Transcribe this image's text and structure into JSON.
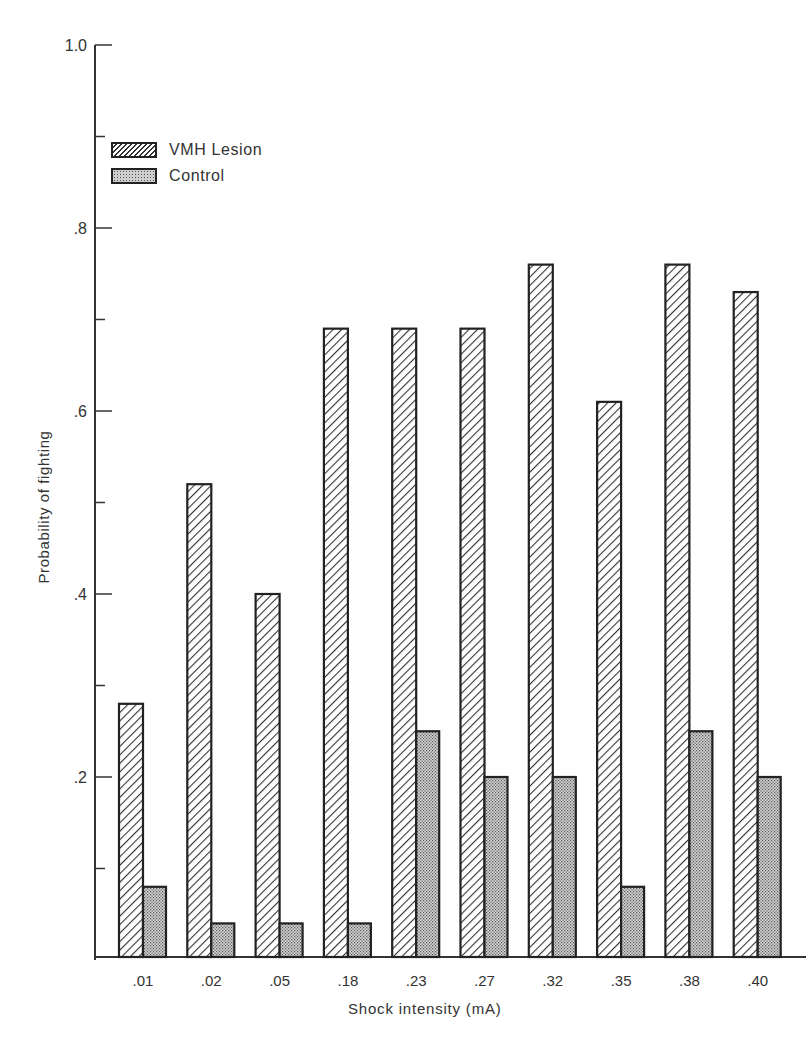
{
  "chart_data": {
    "type": "bar",
    "title": "",
    "xlabel": "Shock intensity (mA)",
    "ylabel": "Probability of fighting",
    "ylim": [
      0,
      1.0
    ],
    "yticks": [
      ".2",
      ".4",
      ".6",
      ".8",
      "1.0"
    ],
    "grid": false,
    "legend_position": "upper left",
    "categories": [
      ".01",
      ".02",
      ".05",
      ".18",
      ".23",
      ".27",
      ".32",
      ".35",
      ".38",
      ".40"
    ],
    "series": [
      {
        "name": "VMH Lesion",
        "pattern": "diagonal-hatch",
        "values": [
          0.28,
          0.52,
          0.4,
          0.69,
          0.69,
          0.69,
          0.76,
          0.61,
          0.76,
          0.73
        ]
      },
      {
        "name": "Control",
        "pattern": "stipple",
        "values": [
          0.08,
          0.04,
          0.04,
          0.04,
          0.25,
          0.2,
          0.2,
          0.08,
          0.25,
          0.2
        ]
      }
    ]
  },
  "legend": {
    "items": [
      {
        "label": "VMH Lesion"
      },
      {
        "label": "Control"
      }
    ]
  },
  "axes": {
    "xlabel": "Shock intensity (mA)",
    "ylabel": "Probability of fighting"
  },
  "colors": {
    "stroke": "#222222",
    "control_fill": "#cfcfcf",
    "background": "#ffffff"
  }
}
